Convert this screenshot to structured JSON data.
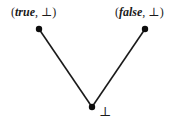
{
  "diagram": {
    "type": "hasse-diagram",
    "title": "",
    "background_color": "#ffffff",
    "line_color": "#1a1a1a",
    "node_color": "#0d0d0d",
    "nodes": [
      {
        "id": "true-bottom",
        "name": "node-true-bottom",
        "label_open_paren": "(",
        "label_value": "true",
        "label_comma": ", ",
        "label_bottom_symbol": "⊥",
        "label_close_paren": ")",
        "full_label": "(true, ⊥)",
        "x": 39,
        "y": 29
      },
      {
        "id": "false-bottom",
        "name": "node-false-bottom",
        "label_open_paren": "(",
        "label_value": "false",
        "label_comma": ", ",
        "label_bottom_symbol": "⊥",
        "label_close_paren": ")",
        "full_label": "(false, ⊥)",
        "x": 145,
        "y": 29
      },
      {
        "id": "bottom",
        "name": "node-bottom",
        "full_label": "⊥",
        "x": 92,
        "y": 107
      }
    ],
    "edges": [
      {
        "name": "edge-bottom-to-true",
        "from": "bottom",
        "to": "true-bottom"
      },
      {
        "name": "edge-bottom-to-false",
        "from": "bottom",
        "to": "false-bottom"
      }
    ]
  }
}
